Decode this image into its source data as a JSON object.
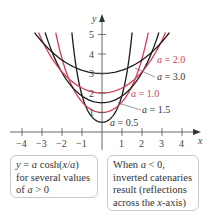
{
  "chart_data": {
    "type": "line",
    "title": "",
    "xlabel": "x",
    "ylabel": "y",
    "xlim": [
      -4.5,
      4.6
    ],
    "ylim": [
      0,
      5.1
    ],
    "grid": false,
    "x_ticks": [
      -4,
      -3,
      -2,
      -1,
      1,
      2,
      3,
      4
    ],
    "x_tick_labels": [
      "−4",
      "−3",
      "−2",
      "−1",
      "1",
      "2",
      "3",
      "4"
    ],
    "y_ticks": [
      1,
      2,
      3,
      4,
      5
    ],
    "y_tick_labels": [
      "1",
      "2",
      "3",
      "4",
      "5"
    ],
    "function": "y = a cosh(x/a)",
    "series": [
      {
        "name": "a = 0.5",
        "a": 0.5,
        "color": "#1a1a1a"
      },
      {
        "name": "a = 1.0",
        "a": 1.0,
        "color": "#d63d55"
      },
      {
        "name": "a = 1.5",
        "a": 1.5,
        "color": "#1a1a1a"
      },
      {
        "name": "a = 2.0",
        "a": 2.0,
        "color": "#d63d55"
      },
      {
        "name": "a = 3.0",
        "a": 3.0,
        "color": "#1a1a1a"
      }
    ],
    "annotations": [
      {
        "text": "a = 2.0",
        "color": "#d63d55"
      },
      {
        "text": "a = 3.0",
        "color": "#333333"
      },
      {
        "text": "a = 1.0",
        "color": "#d63d55"
      },
      {
        "text": "a = 1.5",
        "color": "#333333"
      },
      {
        "text": "a = 0.5",
        "color": "#333333"
      }
    ]
  },
  "notes": {
    "left": {
      "line1_prefix": "y = a cosh(",
      "line1_var": "x/a",
      "line1_suffix": ")",
      "line2": "for several values",
      "line3": "of a > 0"
    },
    "right": {
      "line1": "When a < 0,",
      "line2": "inverted catenaries",
      "line3": "result (reflections",
      "line4": "across the x-axis)"
    }
  }
}
